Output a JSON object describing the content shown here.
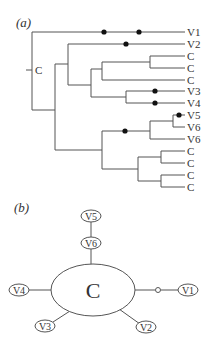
{
  "panel_a": {
    "label": "(a)",
    "root_label": "C",
    "leaves": [
      "V1",
      "V2",
      "C",
      "C",
      "C",
      "V3",
      "V4",
      "V5",
      "V6",
      "V6",
      "C",
      "C",
      "C",
      "C"
    ]
  },
  "panel_b": {
    "label": "(b)",
    "center_label": "C",
    "nodes": {
      "v1": "V1",
      "v2": "V2",
      "v3": "V3",
      "v4": "V4",
      "v5": "V5",
      "v6": "V6"
    }
  }
}
